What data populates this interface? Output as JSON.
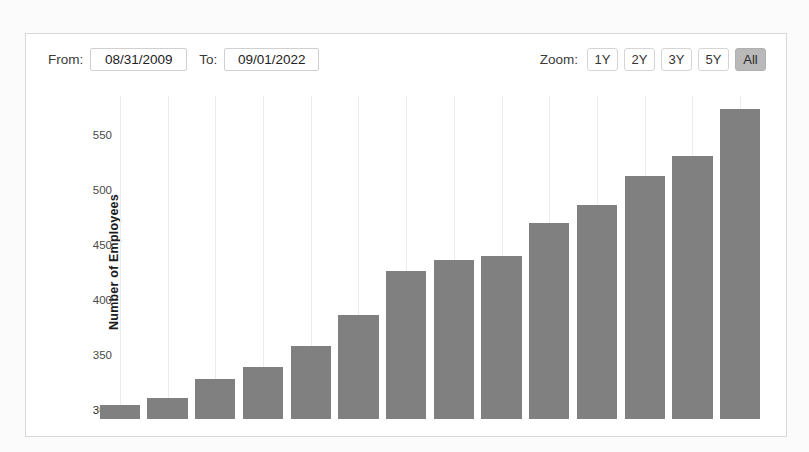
{
  "toolbar": {
    "from_label": "From:",
    "from_value": "08/31/2009",
    "to_label": "To:",
    "to_value": "09/01/2022",
    "zoom_label": "Zoom:",
    "zoom_options": [
      {
        "label": "1Y",
        "active": false
      },
      {
        "label": "2Y",
        "active": false
      },
      {
        "label": "3Y",
        "active": false
      },
      {
        "label": "5Y",
        "active": false
      },
      {
        "label": "All",
        "active": true
      }
    ]
  },
  "colors": {
    "bar": "#808080",
    "card_border": "#d8d8d8",
    "active_button": "#b9b9b9",
    "page_background": "#fbfbfb"
  },
  "chart_data": {
    "type": "bar",
    "title": "",
    "xlabel": "",
    "ylabel": "Number of Employees",
    "ylim": [
      292,
      585
    ],
    "yticks": [
      300,
      350,
      400,
      450,
      500,
      550
    ],
    "ytick_labels": [
      "300",
      "350",
      "400",
      "450",
      "500",
      "550"
    ],
    "grid": false,
    "legend": "none",
    "categories": [
      "1",
      "2",
      "3",
      "4",
      "5",
      "6",
      "7",
      "8",
      "9",
      "10",
      "11",
      "12",
      "13",
      "14"
    ],
    "values": [
      305,
      311,
      328,
      339,
      358,
      386,
      426,
      436,
      440,
      470,
      486,
      512,
      531,
      573
    ]
  }
}
